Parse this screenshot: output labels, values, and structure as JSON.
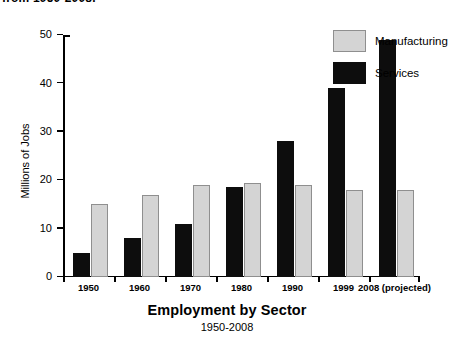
{
  "top_fragment": "from 1950-2008.",
  "chart_data": {
    "type": "bar",
    "title": "Employment by Sector",
    "subtitle": "1950-2008",
    "xlabel": "",
    "ylabel": "Millions of Jobs",
    "ylim": [
      0,
      50
    ],
    "yticks": [
      0,
      10,
      20,
      30,
      40,
      50
    ],
    "grid": false,
    "legend_position": "right",
    "categories": [
      "1950",
      "1960",
      "1970",
      "1980",
      "1990",
      "1999",
      "2008 (projected)"
    ],
    "series": [
      {
        "name": "Services",
        "color": "#0d0d0d",
        "values": [
          5,
          8,
          11,
          18.5,
          28,
          39,
          49
        ]
      },
      {
        "name": "Manufacturing",
        "color": "#d4d4d4",
        "values": [
          15,
          17,
          19,
          19.5,
          19,
          18,
          18
        ]
      }
    ]
  },
  "legend": {
    "manufacturing_label": "Manufacturing",
    "services_label": "Services"
  }
}
